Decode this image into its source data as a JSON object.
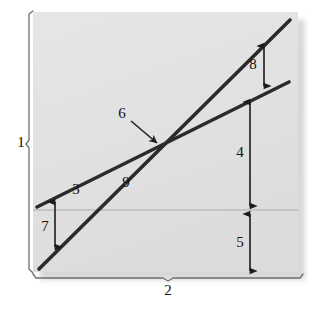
{
  "figure": {
    "type": "schematic-line-diagram",
    "background_color": "#ffffff",
    "plot_area_color": "#e3e3e3",
    "line_color": "#262626",
    "reference_line_color": "#b9b9b9",
    "plot_area": {
      "x": 33,
      "y": 12,
      "width": 265,
      "height": 260
    }
  },
  "axes": {
    "vertical_bracket": {
      "label": "1",
      "label_x": 21,
      "label_y": 144
    },
    "horizontal_bracket": {
      "label": "2",
      "label_x": 168,
      "label_y": 292
    }
  },
  "lines": [
    {
      "id": "flat-line",
      "label": "3",
      "label_x": 76,
      "label_y": 191,
      "x1": 37,
      "y1": 207,
      "x2": 289,
      "y2": 82
    },
    {
      "id": "steep-line",
      "label": "9",
      "label_x": 126,
      "label_y": 184,
      "x1": 39,
      "y1": 269,
      "x2": 290,
      "y2": 20
    }
  ],
  "callouts": [
    {
      "id": "intersection-callout",
      "label": "6",
      "label_x": 122,
      "label_y": 115,
      "leader_x1": 131,
      "leader_y1": 122,
      "leader_x2": 158,
      "leader_y2": 144
    }
  ],
  "dimensions": [
    {
      "id": "dim-8",
      "label": "8",
      "label_x": 253,
      "label_y": 66,
      "x": 264,
      "y1": 46,
      "y2": 86
    },
    {
      "id": "dim-4",
      "label": "4",
      "label_x": 240,
      "label_y": 154,
      "x": 250,
      "y1": 102,
      "y2": 206
    },
    {
      "id": "dim-5",
      "label": "5",
      "label_x": 240,
      "label_y": 244,
      "x": 250,
      "y1": 214,
      "y2": 271
    },
    {
      "id": "dim-7",
      "label": "7",
      "label_x": 45,
      "label_y": 228,
      "x": 55,
      "y1": 202,
      "y2": 247
    }
  ],
  "reference_line": {
    "y": 210,
    "x1": 33,
    "x2": 298
  }
}
